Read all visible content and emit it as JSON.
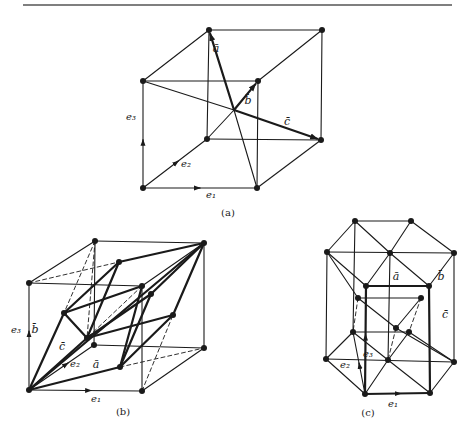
{
  "page": {
    "width": 476,
    "height": 435,
    "bg": "#ffffff",
    "ink": "#1a1a1a"
  },
  "top_rule": {
    "x1": 23,
    "x2": 452,
    "y": 5
  },
  "figures": [
    {
      "id": "a",
      "caption": "(a)",
      "caption_pos": [
        228,
        216
      ],
      "points": {
        "TBL": [
          209,
          30
        ],
        "TBR": [
          322,
          30
        ],
        "TFL": [
          143,
          81
        ],
        "TFR": [
          258,
          81
        ],
        "BBL": [
          207,
          139
        ],
        "BBR": [
          321,
          140
        ],
        "BFL": [
          143,
          188
        ],
        "BFR": [
          257,
          188
        ],
        "C": [
          234,
          110
        ]
      },
      "dots": [
        "TBL",
        "TBR",
        "TFL",
        "TFR",
        "BBL",
        "BBR",
        "BFL",
        "BFR"
      ],
      "thin": [
        [
          "TBL",
          "TBR"
        ],
        [
          "TFL",
          "TFR"
        ],
        [
          "TBL",
          "TFL"
        ],
        [
          "TBR",
          "TFR"
        ],
        [
          "TFL",
          "BFL"
        ],
        [
          "TFR",
          "BFR"
        ],
        [
          "TBR",
          "BBR"
        ],
        [
          "TBL",
          "BBL"
        ],
        [
          "BBL",
          "BBR"
        ],
        [
          "BFL",
          "BFR"
        ],
        [
          "BFL",
          "BBL"
        ],
        [
          "BFR",
          "BBR"
        ],
        [
          "TFL",
          "C"
        ],
        [
          "C",
          "BFR"
        ],
        [
          "BBL",
          "C"
        ]
      ],
      "thick": [],
      "dashed": [],
      "arrows": [
        {
          "from": "C",
          "to": "TBL",
          "width": 2.2,
          "label": "ā",
          "label_pos": [
            216,
            52
          ]
        },
        {
          "from": "C",
          "to": "TFR",
          "width": 2.2,
          "label": "b̄",
          "label_pos": [
            248,
            104
          ]
        },
        {
          "from": "C",
          "to": "BBR",
          "width": 2.2,
          "label": "c̄",
          "label_pos": [
            287,
            125
          ]
        }
      ],
      "unit_vectors": [
        {
          "from": "BFL",
          "to": "BFR",
          "mid": 0.5,
          "label": "e₁",
          "label_pos": [
            211,
            198
          ]
        },
        {
          "from": "BFL",
          "to": "BBL",
          "mid": 0.55,
          "label": "e₂",
          "label_pos": [
            186,
            167
          ]
        },
        {
          "from": "BFL",
          "to": "TFL",
          "mid": 0.45,
          "label": "e₃",
          "label_pos": [
            131,
            120
          ]
        }
      ]
    },
    {
      "id": "b",
      "caption": "(b)",
      "caption_pos": [
        123,
        415
      ],
      "points": {
        "TBL": [
          95,
          241
        ],
        "TBR": [
          204,
          243
        ],
        "TFL": [
          29,
          283
        ],
        "TFR": [
          142,
          286
        ],
        "BBL": [
          94,
          345
        ],
        "BBR": [
          204,
          348
        ],
        "BFL": [
          29,
          390
        ],
        "BFR": [
          142,
          391
        ],
        "P1": [
          119,
          262
        ],
        "P2": [
          64,
          313
        ],
        "P3": [
          151,
          294
        ],
        "P4": [
          87,
          338
        ],
        "P5": [
          173,
          315
        ],
        "P6": [
          120,
          367
        ]
      },
      "dots": [
        "TBL",
        "TBR",
        "TFL",
        "TFR",
        "BBL",
        "BBR",
        "BFL",
        "BFR",
        "P1",
        "P2",
        "P3",
        "P4",
        "P5",
        "P6"
      ],
      "thin": [
        [
          "TBL",
          "TBR"
        ],
        [
          "TFL",
          "TFR"
        ],
        [
          "TBL",
          "TFL"
        ],
        [
          "TBR",
          "TFR"
        ],
        [
          "TFL",
          "BFL"
        ],
        [
          "TFR",
          "BFR"
        ],
        [
          "TBR",
          "BBR"
        ],
        [
          "TBL",
          "BBL"
        ],
        [
          "BBL",
          "BBR"
        ],
        [
          "BFL",
          "BFR"
        ],
        [
          "BFL",
          "BBL"
        ],
        [
          "BFR",
          "BBR"
        ]
      ],
      "thick": [
        [
          "BFL",
          "P2"
        ],
        [
          "BFL",
          "P4"
        ],
        [
          "BFL",
          "P6"
        ],
        [
          "BFL",
          "TBR"
        ],
        [
          "P2",
          "P1"
        ],
        [
          "P2",
          "TFR"
        ],
        [
          "P1",
          "TBR"
        ],
        [
          "P4",
          "P3"
        ],
        [
          "P4",
          "P5"
        ],
        [
          "P3",
          "TBR"
        ],
        [
          "P5",
          "TBR"
        ],
        [
          "P6",
          "P5"
        ],
        [
          "P6",
          "P3"
        ],
        [
          "P2",
          "P4"
        ],
        [
          "P1",
          "P4"
        ],
        [
          "TFR",
          "P6"
        ]
      ],
      "dashed": [
        [
          "TFL",
          "P1"
        ],
        [
          "TBL",
          "P2"
        ],
        [
          "TBL",
          "P4"
        ],
        [
          "P1",
          "P4"
        ],
        [
          "P6",
          "BBR"
        ],
        [
          "BFR",
          "P5"
        ],
        [
          "TFR",
          "P4"
        ]
      ],
      "arrows": [],
      "vec_labels": [
        {
          "text": "b̄",
          "pos": [
            35,
            333
          ]
        },
        {
          "text": "c̄",
          "pos": [
            62,
            350
          ]
        },
        {
          "text": "ā",
          "pos": [
            96,
            368
          ]
        }
      ],
      "unit_vectors": [
        {
          "from": "BFL",
          "to": "BFR",
          "mid": 0.55,
          "label": "e₁",
          "label_pos": [
            96,
            402
          ]
        },
        {
          "from": "BFL",
          "to": "BBL",
          "mid": 0.6,
          "label": "e₂",
          "label_pos": [
            75,
            367
          ]
        },
        {
          "from": "BFL",
          "to": "TFL",
          "mid": 0.55,
          "label": "e₃",
          "label_pos": [
            16,
            333
          ]
        }
      ]
    },
    {
      "id": "c",
      "caption": "(c)",
      "caption_pos": [
        368,
        416
      ],
      "points": {
        "T1": [
          355,
          221
        ],
        "T2": [
          411,
          221
        ],
        "T3": [
          327,
          252
        ],
        "T4": [
          454,
          253
        ],
        "T5": [
          366,
          286
        ],
        "T6": [
          429,
          286
        ],
        "TC": [
          390,
          253
        ],
        "B1": [
          353,
          332
        ],
        "B2": [
          409,
          332
        ],
        "B3": [
          326,
          359
        ],
        "B4": [
          454,
          362
        ],
        "B5": [
          365,
          394
        ],
        "B6": [
          430,
          393
        ],
        "BC": [
          388,
          360
        ],
        "M1": [
          358,
          298
        ],
        "M2": [
          421,
          298
        ],
        "MC": [
          396,
          328
        ]
      },
      "dots": [
        "T1",
        "T2",
        "T3",
        "T4",
        "T5",
        "T6",
        "TC",
        "B1",
        "B2",
        "B3",
        "B4",
        "B5",
        "B6",
        "BC",
        "M1",
        "M2",
        "MC"
      ],
      "thin": [
        [
          "T1",
          "T2"
        ],
        [
          "T1",
          "T3"
        ],
        [
          "T2",
          "T4"
        ],
        [
          "T3",
          "T4"
        ],
        [
          "T1",
          "TC"
        ],
        [
          "T2",
          "TC"
        ],
        [
          "T3",
          "T5"
        ],
        [
          "T4",
          "T6"
        ],
        [
          "TC",
          "T5"
        ],
        [
          "TC",
          "T6"
        ],
        [
          "T3",
          "B3"
        ],
        [
          "T4",
          "B4"
        ],
        [
          "T1",
          "B1"
        ],
        [
          "TC",
          "BC"
        ],
        [
          "B1",
          "B2"
        ],
        [
          "B1",
          "B3"
        ],
        [
          "B2",
          "B4"
        ],
        [
          "B3",
          "B4"
        ],
        [
          "B3",
          "B5"
        ],
        [
          "B4",
          "B6"
        ],
        [
          "B1",
          "BC"
        ],
        [
          "B2",
          "BC"
        ],
        [
          "BC",
          "B5"
        ],
        [
          "BC",
          "B6"
        ],
        [
          "B1",
          "B5"
        ],
        [
          "M1",
          "M2"
        ],
        [
          "M1",
          "MC"
        ],
        [
          "M2",
          "MC"
        ],
        [
          "MC",
          "B4"
        ],
        [
          "T3",
          "M1"
        ]
      ],
      "thick": [
        [
          "T5",
          "T6"
        ],
        [
          "T5",
          "B5"
        ],
        [
          "T6",
          "B6"
        ],
        [
          "B5",
          "B6"
        ]
      ],
      "dashed": [
        [
          "M1",
          "B1"
        ],
        [
          "M2",
          "B2"
        ],
        [
          "MC",
          "BC"
        ]
      ],
      "arrows": [],
      "vec_labels": [
        {
          "text": "ā",
          "pos": [
            396,
            280
          ]
        },
        {
          "text": "b̄",
          "pos": [
            441,
            280
          ]
        },
        {
          "text": "c̄",
          "pos": [
            445,
            318
          ]
        }
      ],
      "unit_vectors": [
        {
          "from": "B5",
          "to": "B6",
          "mid": 0.55,
          "label": "e₁",
          "label_pos": [
            393,
            407
          ]
        },
        {
          "from": "B5",
          "to": "B1",
          "mid": 0.5,
          "label": "e₂",
          "label_pos": [
            345,
            368
          ]
        },
        {
          "from": "B5",
          "to": "T5",
          "mid": 0.55,
          "label": "e₃",
          "label_pos": [
            368,
            357
          ]
        }
      ]
    }
  ]
}
